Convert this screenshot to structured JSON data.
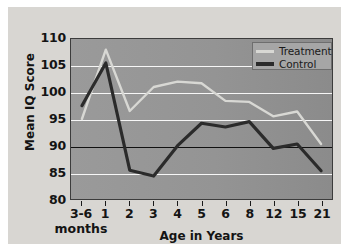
{
  "chart_data": {
    "type": "line",
    "title": "",
    "xlabel": "Age in Years",
    "ylabel": "Mean IQ Score",
    "categories": [
      "3-6",
      "1",
      "2",
      "3",
      "4",
      "5",
      "6",
      "8",
      "12",
      "15",
      "21"
    ],
    "category_sublabel": "months",
    "ylim": [
      80,
      110
    ],
    "yticks": [
      80,
      85,
      90,
      95,
      100,
      105,
      110
    ],
    "ytick_labels": [
      "80",
      "85",
      "90",
      "95",
      "100",
      "105",
      "110"
    ],
    "grid": true,
    "gridlines": [
      85,
      95,
      100,
      105
    ],
    "reference_line": 90,
    "legend_position": "top-right",
    "series": [
      {
        "name": "Treatment",
        "color": "#d8d8d4",
        "values": [
          95.0,
          108.0,
          96.5,
          101.0,
          102.0,
          101.7,
          98.4,
          98.2,
          95.5,
          96.4,
          90.3
        ]
      },
      {
        "name": "Control",
        "color": "#2b2b2b",
        "values": [
          97.5,
          105.5,
          85.4,
          84.3,
          90.0,
          94.2,
          93.5,
          94.5,
          89.5,
          90.3,
          85.3
        ]
      }
    ]
  },
  "legend": {
    "items": [
      {
        "label": "Treatment",
        "color": "#d8d8d4"
      },
      {
        "label": "Control",
        "color": "#2b2b2b"
      }
    ]
  },
  "colors": {
    "figure_background": "#ffffff",
    "panel_background": "#d8d6d2",
    "plot_background": "#949494",
    "gridline": "#ffffff",
    "reference_line": "#111111",
    "axis_text": "#141414",
    "treatment": "#d8d8d4",
    "control": "#2b2b2b"
  }
}
